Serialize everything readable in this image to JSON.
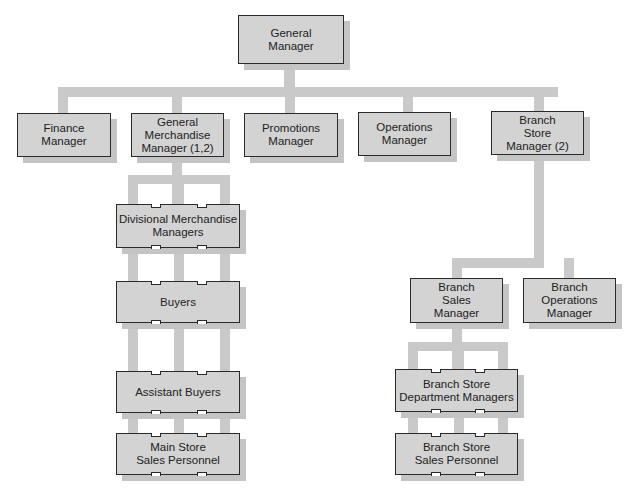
{
  "chart": {
    "type": "organization-chart",
    "colors": {
      "box_fill": "#d3d3d3",
      "box_border": "#2a2a2a",
      "connector": "#c9c9c9",
      "shadow": "#c4c4c4"
    },
    "root": {
      "label": "General\nManager"
    },
    "level1": [
      {
        "id": "finance",
        "label": "Finance\nManager"
      },
      {
        "id": "gmm",
        "label": "General\nMerchandise\nManager (1,2)"
      },
      {
        "id": "promotions",
        "label": "Promotions\nManager"
      },
      {
        "id": "operations",
        "label": "Operations\nManager"
      },
      {
        "id": "branch_store",
        "label": "Branch\nStore\nManager (2)"
      }
    ],
    "merchandise_chain": [
      {
        "id": "div_merch",
        "label": "Divisional Merchandise\nManagers"
      },
      {
        "id": "buyers",
        "label": "Buyers"
      },
      {
        "id": "assistant_buyers",
        "label": "Assistant Buyers"
      },
      {
        "id": "main_store_sales",
        "label": "Main Store\nSales Personnel"
      }
    ],
    "branch_level2": [
      {
        "id": "branch_sales",
        "label": "Branch\nSales\nManager"
      },
      {
        "id": "branch_ops",
        "label": "Branch\nOperations\nManager"
      }
    ],
    "branch_chain": [
      {
        "id": "branch_dept",
        "label": "Branch Store\nDepartment Managers"
      },
      {
        "id": "branch_sales_personnel",
        "label": "Branch Store\nSales Personnel"
      }
    ]
  }
}
